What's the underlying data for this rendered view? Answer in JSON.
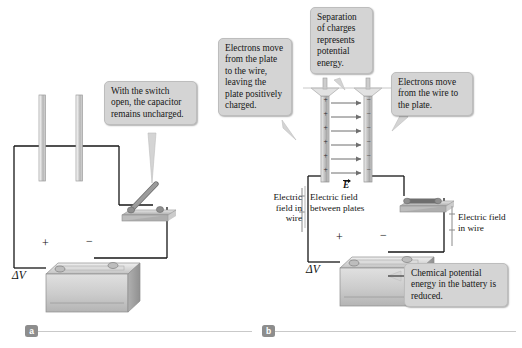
{
  "figure": {
    "panels": [
      {
        "id": "a",
        "label": "a"
      },
      {
        "id": "b",
        "label": "b"
      }
    ]
  },
  "callouts": [
    {
      "id": "switch-open-callout",
      "text": "With the switch open, the capacitor remains uncharged."
    },
    {
      "id": "electrons-leave-plate-callout",
      "text": "Electrons move from the plate to the wire, leaving the plate positively charged."
    },
    {
      "id": "separation-of-charges-callout",
      "text": "Separation of charges represents potential energy."
    },
    {
      "id": "electrons-to-plate-callout",
      "text": "Electrons move from the wire to the plate."
    },
    {
      "id": "chemical-energy-callout",
      "text": "Chemical potential energy in the battery is reduced."
    }
  ],
  "labels": {
    "electric_field_in_wire_left": "Electric field in wire",
    "electric_field_between_plates": "Electric field between plates",
    "electric_field_in_wire_right": "Electric field in wire",
    "e_vector": "E",
    "delta_v_a": "ΔV",
    "delta_v_b": "ΔV",
    "battery_plus_a": "+",
    "battery_minus_a": "−",
    "battery_plus_b": "+",
    "battery_minus_b": "−"
  },
  "plate_charges": {
    "positive_symbol": "+",
    "negative_symbol": "−",
    "count_per_plate": 6
  },
  "colors": {
    "callout_fill": "#d4d4d4",
    "callout_border": "#bdbdbd",
    "wire": "#161616",
    "panel_chip": "#8d8d8d",
    "rule": "#c9c9c9",
    "plate_light": "#f2f2f2",
    "plate_mid": "#b9b9b9",
    "battery_body": "#cfcfcf",
    "arrow": "#6f6f6f"
  }
}
